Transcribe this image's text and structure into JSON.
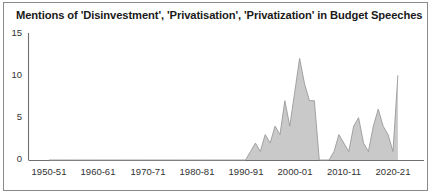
{
  "chart_data": {
    "type": "area",
    "title": "Mentions of 'Disinvestment', 'Privatisation', 'Privatization' in Budget Speeches",
    "xlabel": "",
    "ylabel": "",
    "ylim": [
      0,
      15
    ],
    "yticks": [
      0,
      5,
      10,
      15
    ],
    "ytick_labels": [
      "0",
      "5",
      "10",
      "15"
    ],
    "xtick_labels": [
      "1950-51",
      "1960-61",
      "1970-71",
      "1980-81",
      "1990-91",
      "2000-01",
      "2010-11",
      "2020-21"
    ],
    "xtick_years": [
      1950,
      1960,
      1970,
      1980,
      1990,
      2000,
      2010,
      2020
    ],
    "grid": false,
    "legend": false,
    "fill_color": "#c9c9c9",
    "line_color": "#9a9a9a",
    "axis_color": "#6f6f6f",
    "x": [
      1950,
      1951,
      1952,
      1953,
      1954,
      1955,
      1956,
      1957,
      1958,
      1959,
      1960,
      1961,
      1962,
      1963,
      1964,
      1965,
      1966,
      1967,
      1968,
      1969,
      1970,
      1971,
      1972,
      1973,
      1974,
      1975,
      1976,
      1977,
      1978,
      1979,
      1980,
      1981,
      1982,
      1983,
      1984,
      1985,
      1986,
      1987,
      1988,
      1989,
      1990,
      1991,
      1992,
      1993,
      1994,
      1995,
      1996,
      1997,
      1998,
      1999,
      2000,
      2001,
      2002,
      2003,
      2004,
      2005,
      2006,
      2007,
      2008,
      2009,
      2010,
      2011,
      2012,
      2013,
      2014,
      2015,
      2016,
      2017,
      2018,
      2019,
      2020,
      2021
    ],
    "values": [
      0,
      0,
      0,
      0,
      0,
      0,
      0,
      0,
      0,
      0,
      0,
      0,
      0,
      0,
      0,
      0,
      0,
      0,
      0,
      0,
      0,
      0,
      0,
      0,
      0,
      0,
      0,
      0,
      0,
      0,
      0,
      0,
      0,
      0,
      0,
      0,
      0,
      0,
      0,
      0,
      0,
      1,
      2,
      1,
      3,
      2,
      4,
      3,
      7,
      4,
      8,
      12,
      9,
      7,
      7,
      0,
      0,
      0,
      1,
      3,
      2,
      1,
      4,
      5,
      2,
      1,
      4,
      6,
      4,
      3,
      1,
      10
    ],
    "series_name": "Mentions"
  },
  "axis": {
    "y_label_0": "0",
    "y_label_5": "5",
    "y_label_10": "10",
    "y_label_15": "15"
  }
}
